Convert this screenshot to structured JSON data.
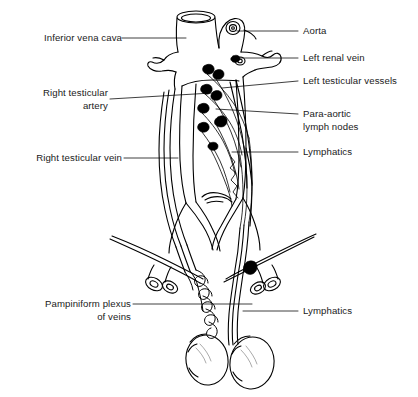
{
  "figure": {
    "type": "anatomical-line-diagram",
    "background_color": "#ffffff",
    "line_color": "#000000",
    "text_color": "#1a1a1a",
    "fill_color_lymph_nodes": "#000000",
    "width": 418,
    "height": 397
  },
  "labels": {
    "left": [
      {
        "id": "inferior-vena-cava",
        "text": "Inferior vena cava",
        "lines": [
          "Inferior vena cava"
        ]
      },
      {
        "id": "right-testicular-artery",
        "text": "Right testicular artery",
        "lines": [
          "Right testicular",
          "artery"
        ]
      },
      {
        "id": "right-testicular-vein",
        "text": "Right testicular vein",
        "lines": [
          "Right testicular vein"
        ]
      },
      {
        "id": "pampiniform-plexus-of-veins",
        "text": "Pampiniform plexus of veins",
        "lines": [
          "Pampiniform plexus",
          "of veins"
        ]
      }
    ],
    "right": [
      {
        "id": "aorta",
        "text": "Aorta",
        "lines": [
          "Aorta"
        ]
      },
      {
        "id": "left-renal-vein",
        "text": "Left renal vein",
        "lines": [
          "Left renal vein"
        ]
      },
      {
        "id": "left-testicular-vessels",
        "text": "Left testicular vessels",
        "lines": [
          "Left testicular vessels"
        ]
      },
      {
        "id": "para-aortic-lymph-nodes",
        "text": "Para-aortic lymph nodes",
        "lines": [
          "Para-aortic",
          "lymph nodes"
        ]
      },
      {
        "id": "lymphatics-upper",
        "text": "Lymphatics",
        "lines": [
          "Lymphatics"
        ]
      },
      {
        "id": "lymphatics-lower",
        "text": "Lymphatics",
        "lines": [
          "Lymphatics"
        ]
      }
    ]
  },
  "structures": [
    {
      "id": "inferior-vena-cava",
      "name": "Inferior vena cava",
      "description": "Large cut venous trunk, upper left of midline"
    },
    {
      "id": "aorta",
      "name": "Aorta",
      "description": "Cut arterial trunk with lumen, upper right of midline"
    },
    {
      "id": "left-renal-vein",
      "name": "Left renal vein",
      "description": "Horizontal branch crossing to the right"
    },
    {
      "id": "right-renal-vein",
      "name": "Right renal vein",
      "description": "Short branch to the left"
    },
    {
      "id": "para-aortic-lymph-nodes",
      "name": "Para-aortic lymph nodes",
      "description": "Solid black teardrop nodes along aorta"
    },
    {
      "id": "lymphatic-channels",
      "name": "Lymphatics",
      "description": "Fine parallel lines ascending to para-aortic nodes"
    },
    {
      "id": "left-testicular-vessels",
      "name": "Left testicular vessels",
      "description": "Vessel bundle descending on left side"
    },
    {
      "id": "right-testicular-artery",
      "name": "Right testicular artery",
      "description": "Thin vessel descending on right of image"
    },
    {
      "id": "right-testicular-vein",
      "name": "Right testicular vein",
      "description": "Vessel descending parallel to artery"
    },
    {
      "id": "common-iliac-vessels",
      "name": "Common iliac vessels",
      "description": "Bifurcation forming pelvic arch"
    },
    {
      "id": "inguinal-ligament",
      "name": "Inguinal ligament",
      "description": "Oblique line across each groin"
    },
    {
      "id": "pampiniform-plexus",
      "name": "Pampiniform plexus of veins",
      "description": "Coiled venous plexus in spermatic cord"
    },
    {
      "id": "testis-left",
      "name": "Testis",
      "description": "Oval gland, lower left"
    },
    {
      "id": "testis-right",
      "name": "Testis",
      "description": "Oval gland, lower right"
    }
  ]
}
